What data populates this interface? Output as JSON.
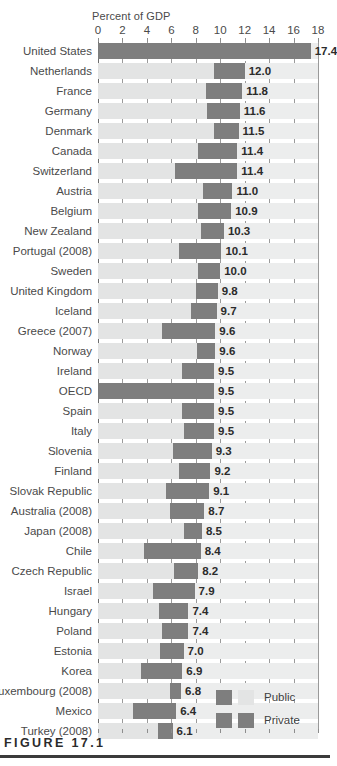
{
  "figure": {
    "caption": "FIGURE 17.1"
  },
  "chart_data": {
    "type": "bar",
    "orientation": "horizontal",
    "stacked": true,
    "title": "",
    "xlabel": "Percent of GDP",
    "ylabel": "",
    "xlim": [
      0,
      18
    ],
    "xticks": [
      0,
      2,
      4,
      6,
      8,
      10,
      12,
      14,
      16,
      18
    ],
    "xtick_labels": [
      "0",
      "2",
      "4",
      "6",
      "8",
      "10",
      "12",
      "14",
      "16",
      "18"
    ],
    "grid": true,
    "legend_position": "bottom-right",
    "legend": [
      "Public",
      "Private"
    ],
    "series": [
      {
        "name": "Public",
        "color": "#e3e4e4",
        "values": [
          0.0,
          9.5,
          8.8,
          8.9,
          9.5,
          8.2,
          6.3,
          8.6,
          8.2,
          8.4,
          6.6,
          8.2,
          8.0,
          7.6,
          5.2,
          8.1,
          6.9,
          0.0,
          6.9,
          7.0,
          6.1,
          6.6,
          5.6,
          5.9,
          7.0,
          3.8,
          6.2,
          4.5,
          5.0,
          5.2,
          5.1,
          3.5,
          5.9,
          2.9,
          4.9
        ]
      },
      {
        "name": "Private",
        "color": "#7e7e7e",
        "values": [
          17.4,
          2.5,
          3.0,
          2.7,
          2.0,
          3.2,
          5.1,
          2.4,
          2.7,
          1.9,
          3.5,
          1.8,
          1.8,
          2.1,
          4.4,
          1.5,
          2.6,
          9.5,
          2.6,
          2.5,
          3.2,
          2.6,
          3.5,
          2.8,
          1.5,
          4.6,
          2.0,
          3.4,
          2.4,
          2.2,
          1.9,
          3.4,
          0.9,
          3.5,
          1.2
        ]
      }
    ],
    "categories": [
      "United States",
      "Netherlands",
      "France",
      "Germany",
      "Denmark",
      "Canada",
      "Switzerland",
      "Austria",
      "Belgium",
      "New Zealand",
      "Portugal (2008)",
      "Sweden",
      "United Kingdom",
      "Iceland",
      "Greece (2007)",
      "Norway",
      "Ireland",
      "OECD",
      "Spain",
      "Italy",
      "Slovenia",
      "Finland",
      "Slovak Republic",
      "Australia (2008)",
      "Japan (2008)",
      "Chile",
      "Czech Republic",
      "Israel",
      "Hungary",
      "Poland",
      "Estonia",
      "Korea",
      "Luxembourg (2008)",
      "Mexico",
      "Turkey (2008)"
    ],
    "totals": [
      17.4,
      12.0,
      11.8,
      11.6,
      11.5,
      11.4,
      11.4,
      11.0,
      10.9,
      10.3,
      10.1,
      10.0,
      9.8,
      9.7,
      9.6,
      9.6,
      9.5,
      9.5,
      9.5,
      9.5,
      9.3,
      9.2,
      9.1,
      8.7,
      8.5,
      8.4,
      8.2,
      7.9,
      7.4,
      7.4,
      7.0,
      6.9,
      6.8,
      6.4,
      6.1
    ],
    "value_labels": [
      "17.4",
      "12.0",
      "11.8",
      "11.6",
      "11.5",
      "11.4",
      "11.4",
      "11.0",
      "10.9",
      "10.3",
      "10.1",
      "10.0",
      "9.8",
      "9.7",
      "9.6",
      "9.6",
      "9.5",
      "9.5",
      "9.5",
      "9.5",
      "9.3",
      "9.2",
      "9.1",
      "8.7",
      "8.5",
      "8.4",
      "8.2",
      "7.9",
      "7.4",
      "7.4",
      "7.0",
      "6.9",
      "6.8",
      "6.4",
      "6.1"
    ]
  },
  "legend": {
    "rows": [
      {
        "label": "Public",
        "swatch_a": "#7e7e7e",
        "swatch_b": "#e3e4e4"
      },
      {
        "label": "Private",
        "swatch_a": "#7e7e7e",
        "swatch_b": "#7e7e7e"
      }
    ]
  },
  "colors": {
    "public": "#e3e4e4",
    "private": "#7e7e7e",
    "band": "#eceded",
    "grid": "#9a9a9a",
    "text": "#4a4a4a"
  }
}
